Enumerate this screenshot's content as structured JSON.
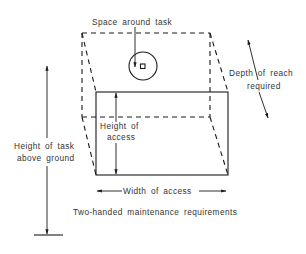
{
  "diagram": {
    "title": "Two-handed maintenance requirements",
    "labels": {
      "space_around_task": "Space around task",
      "depth_line1": "Depth of reach",
      "depth_line2": "required",
      "height_access_line1": "Height of",
      "height_access_line2": "access",
      "height_task_line1": "Height of task",
      "height_task_line2": "above ground",
      "width_access": "Width of access"
    },
    "colors": {
      "line": "#1a1a1a",
      "text": "#333333",
      "background": "#ffffff"
    }
  }
}
